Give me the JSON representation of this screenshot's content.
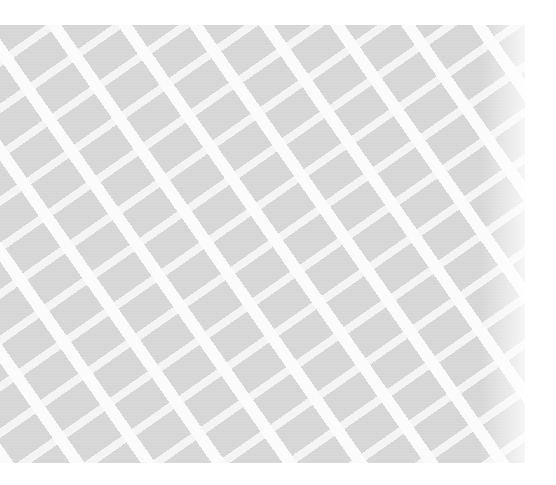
{
  "image": {
    "subject": "woven fabric texture with diagonal lattice pattern",
    "colors": {
      "base": "#d6d6d6",
      "stripe": "#ffffff",
      "background": "#ffffff"
    }
  }
}
